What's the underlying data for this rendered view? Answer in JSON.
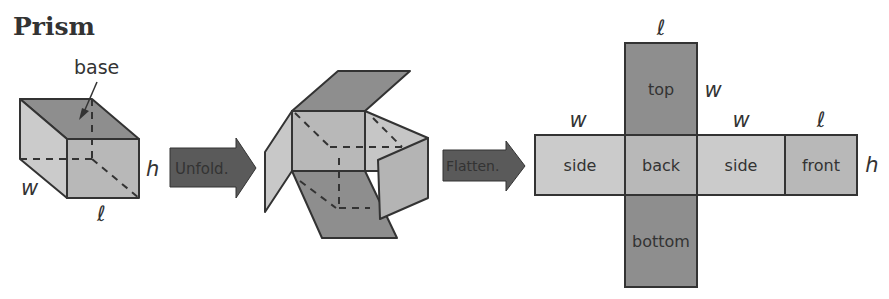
{
  "title": "Prism",
  "prism_3d": {
    "base_label": "base",
    "dim_width": "w",
    "dim_height": "h",
    "dim_length": "ℓ"
  },
  "arrows": {
    "unfold_label": "Unfold.",
    "flatten_label": "Flatten."
  },
  "net": {
    "faces": {
      "top": "top",
      "left_side": "side",
      "back": "back",
      "right_side": "side",
      "front": "front",
      "bottom": "bottom"
    },
    "dims": {
      "top_width_label": "ℓ",
      "top_side_label": "w",
      "left_side_label": "w",
      "right_side_label": "w",
      "front_label": "ℓ",
      "height_label": "h"
    }
  },
  "colors": {
    "dark_face": "#8a8a8a",
    "mid_face": "#b4b4b4",
    "light_face": "#cfcfcf",
    "stroke": "#333333",
    "arrow_fill": "#5a5a5a"
  }
}
